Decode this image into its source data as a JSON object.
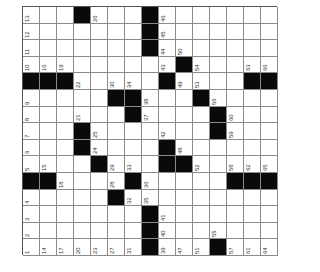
{
  "puzzle": {
    "rows": 15,
    "cols": 15,
    "orientation": "rotated-90-ccw",
    "colors": {
      "block": "#0a0a0a",
      "cell": "#ffffff",
      "line": "#8a8a8a",
      "number": "#333333"
    },
    "grid": [
      [
        "13",
        "",
        "",
        "#",
        "26",
        "",
        "",
        "#",
        "46",
        "",
        "",
        "",
        "",
        "",
        ""
      ],
      [
        "12",
        "",
        "",
        "",
        "",
        "",
        "",
        "#",
        "45",
        "",
        "",
        "",
        "",
        "",
        ""
      ],
      [
        "11",
        "",
        "",
        "",
        "",
        "",
        "",
        "#",
        "44",
        "50",
        "",
        "",
        "",
        "",
        ""
      ],
      [
        "10",
        "16",
        "19",
        "",
        "",
        "",
        "",
        "",
        "43",
        "#",
        "54",
        "",
        "",
        "63",
        "66"
      ],
      [
        "#",
        "#",
        "#",
        "22",
        "",
        "30",
        "34",
        "",
        "#",
        "49",
        "53",
        "",
        "",
        "#",
        "#"
      ],
      [
        "9",
        "",
        "",
        "",
        "",
        "#",
        "#",
        "38",
        "",
        "",
        "#",
        "56",
        "",
        "",
        ""
      ],
      [
        "8",
        "",
        "",
        "21",
        "",
        "",
        "#",
        "37",
        "",
        "",
        "",
        "#",
        "60",
        "",
        ""
      ],
      [
        "7",
        "",
        "",
        "#",
        "25",
        "",
        "",
        "",
        "42",
        "",
        "",
        "#",
        "59",
        "",
        ""
      ],
      [
        "6",
        "",
        "",
        "#",
        "24",
        "",
        "",
        "",
        "#",
        "48",
        "",
        "",
        "",
        "",
        ""
      ],
      [
        "5",
        "15",
        "",
        "",
        "#",
        "29",
        "33",
        "",
        "#",
        "#",
        "52",
        "",
        "58",
        "62",
        "65"
      ],
      [
        "#",
        "#",
        "18",
        "",
        "",
        "28",
        "#",
        "36",
        "",
        "",
        "",
        "",
        "#",
        "#",
        "#"
      ],
      [
        "4",
        "",
        "",
        "",
        "",
        "#",
        "32",
        "35",
        "",
        "",
        "",
        "",
        "",
        "",
        ""
      ],
      [
        "3",
        "",
        "",
        "",
        "",
        "",
        "",
        "#",
        "41",
        "",
        "",
        "",
        "",
        "",
        ""
      ],
      [
        "2",
        "",
        "",
        "",
        "",
        "",
        "",
        "#",
        "40",
        "",
        "",
        "55",
        "",
        "",
        ""
      ],
      [
        "1",
        "14",
        "17",
        "20",
        "23",
        "27",
        "31",
        "#",
        "39",
        "47",
        "51",
        "#",
        "57",
        "61",
        "64"
      ]
    ]
  }
}
